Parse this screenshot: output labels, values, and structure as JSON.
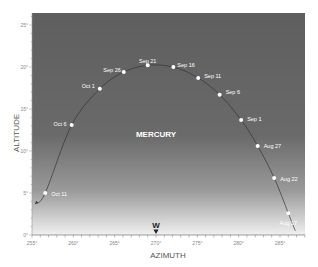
{
  "chart_data": {
    "type": "scatter",
    "title": "",
    "xlabel": "AZIMUTH",
    "ylabel": "ALTITUDE",
    "xlim": [
      255,
      288
    ],
    "ylim": [
      0,
      26.5
    ],
    "x_ticks": [
      255,
      260,
      265,
      270,
      275,
      280,
      285
    ],
    "x_tick_labels": [
      "255°",
      "260°",
      "265°",
      "270°",
      "275°",
      "280°",
      "285°"
    ],
    "y_ticks": [
      0,
      5,
      10,
      15,
      20,
      25
    ],
    "y_tick_labels": [
      "0°",
      "5°",
      "10°",
      "15°",
      "20°",
      "25°"
    ],
    "grid": false,
    "annotations": [
      {
        "text": "MERCURY",
        "x": 270,
        "y": 12
      },
      {
        "text": "W",
        "x": 270,
        "y": 0,
        "marker": "down-triangle"
      }
    ],
    "series": [
      {
        "name": "Mercury path",
        "points": [
          {
            "label": "Aug 17",
            "x": 286.0,
            "y": 2.6
          },
          {
            "label": "Aug 22",
            "x": 284.3,
            "y": 6.8
          },
          {
            "label": "Aug 27",
            "x": 282.3,
            "y": 10.6
          },
          {
            "label": "Sep 1",
            "x": 280.3,
            "y": 13.7
          },
          {
            "label": "Sep 6",
            "x": 277.7,
            "y": 16.7
          },
          {
            "label": "Sep 11",
            "x": 275.1,
            "y": 18.7
          },
          {
            "label": "Sep 16",
            "x": 272.1,
            "y": 20.0
          },
          {
            "label": "Sep 21",
            "x": 269.0,
            "y": 20.2
          },
          {
            "label": "Sep 26",
            "x": 266.1,
            "y": 19.4
          },
          {
            "label": "Oct 1",
            "x": 263.2,
            "y": 17.4
          },
          {
            "label": "Oct 6",
            "x": 259.8,
            "y": 13.1
          },
          {
            "label": "Oct 11",
            "x": 256.6,
            "y": 5.0
          }
        ]
      }
    ],
    "colors": {
      "sky_top": "#5e5e5e",
      "sky_bottom": "#f2f2f2",
      "path": "#333333",
      "point": "#ffffff"
    }
  }
}
